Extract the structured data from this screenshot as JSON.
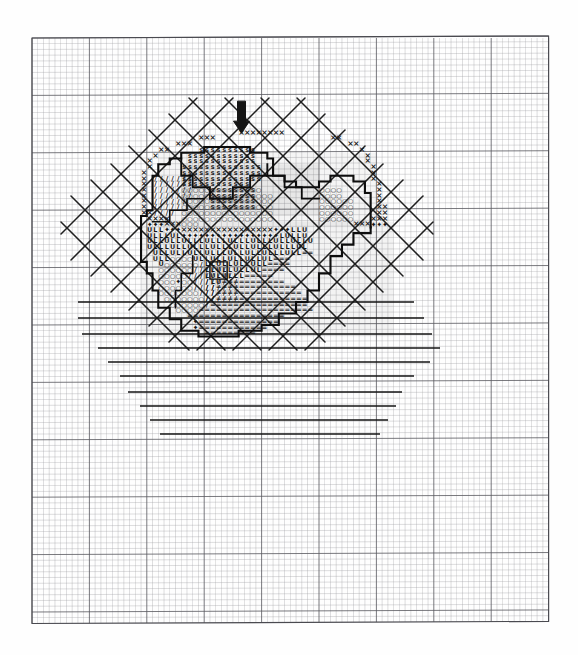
{
  "document": {
    "kind": "cross-stitch-pattern-chart",
    "title": "",
    "background_color": "#fefefe",
    "paper_color": "#ffffff"
  },
  "grid": {
    "name": "graph-paper-grid",
    "origin_x": 32,
    "origin_y": 38,
    "cell_px": 5.74,
    "cols": 90,
    "rows": 102,
    "minor_color": "#9b9b9f",
    "major_color": "#5a5a60",
    "major_every": 10,
    "border_color": "#4a4a50"
  },
  "marker": {
    "name": "center-arrow-marker",
    "symbol": "↓",
    "color": "#151515",
    "cell_col": 36,
    "cell_row": 11
  },
  "legend_symbols": [
    {
      "key": "X",
      "glyph": "×",
      "color": "#1b1b1b",
      "label": "x-stitch-symbol"
    },
    {
      "key": "S",
      "glyph": "s",
      "color": "#1b1b1b",
      "label": "s-stitch-symbol"
    },
    {
      "key": "O",
      "glyph": "○",
      "color": "#1b1b1b",
      "label": "o-stitch-symbol"
    },
    {
      "key": "L",
      "glyph": "L",
      "color": "#1b1b1b",
      "label": "l-stitch-symbol"
    },
    {
      "key": "U",
      "glyph": "U",
      "color": "#1b1b1b",
      "label": "u-stitch-symbol"
    },
    {
      "key": "EQ",
      "glyph": "=",
      "color": "#1b1b1b",
      "label": "equals-stitch-symbol"
    },
    {
      "key": "DIAMOND",
      "glyph": "♦",
      "color": "#0d0d0d",
      "label": "diamond-stitch-symbol"
    },
    {
      "key": "SLASH",
      "glyph": "/",
      "color": "#1b1b1b",
      "label": "slash-stitch-symbol"
    }
  ],
  "chart_data": {
    "type": "heatmap",
    "title": "",
    "xlabel": "",
    "ylabel": "",
    "grid": true,
    "legend_position": "none",
    "cols": 90,
    "rows": 102,
    "note": "Symbol grid of a fruit motif; each row string maps one grid row, '.' = empty cell.",
    "symbol_rows": [
      {
        "row": 16,
        "col": 36,
        "text": "XXXXXXXX"
      },
      {
        "row": 17,
        "col": 29,
        "text": "XXX"
      },
      {
        "row": 17,
        "col": 52,
        "text": "XX"
      },
      {
        "row": 18,
        "col": 25,
        "text": "XXX"
      },
      {
        "row": 18,
        "col": 55,
        "text": "XX"
      },
      {
        "row": 19,
        "col": 22,
        "text": "XX"
      },
      {
        "row": 19,
        "col": 57,
        "text": "X"
      },
      {
        "row": 20,
        "col": 21,
        "text": "X"
      },
      {
        "row": 20,
        "col": 58,
        "text": "X"
      },
      {
        "row": 21,
        "col": 20,
        "text": "X"
      },
      {
        "row": 21,
        "col": 58,
        "text": "X"
      },
      {
        "row": 22,
        "col": 20,
        "text": "X"
      },
      {
        "row": 22,
        "col": 59,
        "text": "X"
      },
      {
        "row": 23,
        "col": 19,
        "text": "X"
      },
      {
        "row": 23,
        "col": 59,
        "text": "X"
      },
      {
        "row": 24,
        "col": 19,
        "text": "X"
      },
      {
        "row": 24,
        "col": 59,
        "text": "X"
      },
      {
        "row": 25,
        "col": 19,
        "text": "X"
      },
      {
        "row": 25,
        "col": 60,
        "text": "X"
      },
      {
        "row": 26,
        "col": 19,
        "text": "X"
      },
      {
        "row": 26,
        "col": 60,
        "text": "X"
      },
      {
        "row": 27,
        "col": 19,
        "text": "X"
      },
      {
        "row": 27,
        "col": 60,
        "text": "X"
      },
      {
        "row": 28,
        "col": 19,
        "text": "X"
      },
      {
        "row": 28,
        "col": 60,
        "text": "X"
      },
      {
        "row": 29,
        "col": 19,
        "text": "X"
      },
      {
        "row": 29,
        "col": 60,
        "text": "XX"
      },
      {
        "row": 30,
        "col": 19,
        "text": "XX"
      },
      {
        "row": 30,
        "col": 60,
        "text": "XX"
      },
      {
        "row": 31,
        "col": 20,
        "text": "XXXX"
      },
      {
        "row": 31,
        "col": 59,
        "text": "XXX"
      },
      {
        "row": 32,
        "col": 20,
        "text": "♦♦♦XXXOOO"
      },
      {
        "row": 32,
        "col": 56,
        "text": "XXX♦♦♦"
      },
      {
        "row": 33,
        "col": 20,
        "text": "ULL♦♦♦XXXXXXXXXXXXXXXX♦♦♦LLU"
      },
      {
        "row": 34,
        "col": 20,
        "text": "ULLLUL♦♦♦♦♦♦♦♦♦♦♦♦♦♦♦♦♦LULLU"
      },
      {
        "row": 35,
        "col": 20,
        "text": "ULLULLULLLULLLULLLULLLULLULLU"
      },
      {
        "row": 36,
        "col": 20,
        "text": "ULLLULLULLLULLLULLULLLULLLUL"
      },
      {
        "row": 37,
        "col": 21,
        "text": "ULLULLULLULLLULLULLULLLULL=="
      },
      {
        "row": 38,
        "col": 21,
        "text": "ULLOOOOULLULLULLULLUL==="
      },
      {
        "row": 39,
        "col": 22,
        "text": "UOOOOOO/LLULLULLULL===="
      },
      {
        "row": 40,
        "col": 22,
        "text": "OOOOOO//LLULLULLUL===="
      },
      {
        "row": 41,
        "col": 22,
        "text": "OOOOO///LULULLL====="
      },
      {
        "row": 42,
        "col": 22,
        "text": "OOO♦OO///LU==========="
      },
      {
        "row": 43,
        "col": 22,
        "text": "OOOOOO////=============="
      },
      {
        "row": 44,
        "col": 22,
        "text": "OOOOOOO///==============="
      },
      {
        "row": 45,
        "col": 23,
        "text": "OOOOOOO//================"
      },
      {
        "row": 46,
        "col": 24,
        "text": "OOOOOO/================="
      },
      {
        "row": 47,
        "col": 25,
        "text": "OOOO===================="
      },
      {
        "row": 48,
        "col": 27,
        "text": "================="
      },
      {
        "row": 49,
        "col": 28,
        "text": "♦=============="
      },
      {
        "row": 50,
        "col": 28,
        "text": "♦============"
      },
      {
        "row": 51,
        "col": 30,
        "text": "========="
      }
    ],
    "lattice_backstitch": {
      "description": "diagonal lattice of backstitch lines behind the motif",
      "spacing_px": 36,
      "color": "#1f1f1f",
      "region": {
        "x": 55,
        "y": 95,
        "w": 380,
        "h": 250
      }
    },
    "horizontal_backstitch_lines": [
      {
        "y": 302,
        "x1": 78,
        "x2": 414
      },
      {
        "y": 318,
        "x1": 78,
        "x2": 424
      },
      {
        "y": 334,
        "x1": 82,
        "x2": 432
      },
      {
        "y": 348,
        "x1": 98,
        "x2": 440
      },
      {
        "y": 362,
        "x1": 108,
        "x2": 430
      },
      {
        "y": 376,
        "x1": 120,
        "x2": 414
      },
      {
        "y": 392,
        "x1": 128,
        "x2": 402
      },
      {
        "y": 406,
        "x1": 140,
        "x2": 396
      },
      {
        "y": 420,
        "x1": 150,
        "x2": 388
      },
      {
        "y": 434,
        "x1": 160,
        "x2": 380
      }
    ]
  }
}
